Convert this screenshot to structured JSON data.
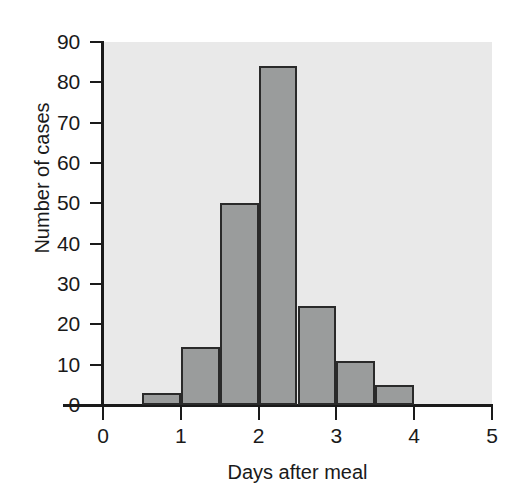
{
  "chart_data": {
    "type": "bar",
    "title": "",
    "subtitle": "",
    "xlabel": "Days after meal",
    "ylabel": "Number of cases",
    "xlim": [
      0,
      5
    ],
    "ylim": [
      0,
      90
    ],
    "grid": false,
    "legend": null,
    "bin_width": 0.5,
    "xticks": [
      "0",
      "1",
      "2",
      "3",
      "4",
      "5"
    ],
    "xtick_values": [
      0,
      1,
      2,
      3,
      4,
      5
    ],
    "yticks": [
      "0",
      "10",
      "20",
      "30",
      "40",
      "50",
      "60",
      "70",
      "80",
      "90"
    ],
    "ytick_values": [
      0,
      10,
      20,
      30,
      40,
      50,
      60,
      70,
      80,
      90
    ],
    "categories": [
      "0.5-1.0",
      "1.0-1.5",
      "1.5-2.0",
      "2.0-2.5",
      "2.5-3.0",
      "3.0-3.5",
      "3.5-4.0"
    ],
    "bins": [
      {
        "start": 0.5,
        "end": 1.0,
        "value": 3
      },
      {
        "start": 1.0,
        "end": 1.5,
        "value": 14.5
      },
      {
        "start": 1.5,
        "end": 2.0,
        "value": 50
      },
      {
        "start": 2.0,
        "end": 2.5,
        "value": 84
      },
      {
        "start": 2.5,
        "end": 3.0,
        "value": 24.5
      },
      {
        "start": 3.0,
        "end": 3.5,
        "value": 11
      },
      {
        "start": 3.5,
        "end": 4.0,
        "value": 5
      }
    ],
    "values": [
      3,
      14.5,
      50,
      84,
      24.5,
      11,
      5
    ],
    "colors": {
      "bar_fill": "#9a9c9c",
      "bar_edge": "#2a2a2a",
      "plot_background": "#e9e9e9",
      "figure_background": "#ffffff",
      "axis": "#1a1a1a",
      "text": "#1a1a1a"
    }
  }
}
